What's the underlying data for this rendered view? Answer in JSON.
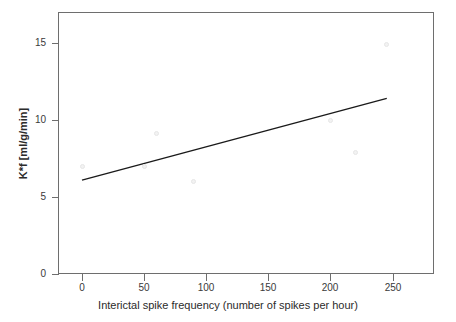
{
  "chart_data": {
    "type": "scatter",
    "title": "",
    "xlabel": "Interictal spike frequency (number of spikes per hour)",
    "ylabel": "K*f [ml/g/min]",
    "xlim": [
      -10,
      290
    ],
    "ylim": [
      0,
      16.6
    ],
    "xticks": [
      0,
      50,
      100,
      150,
      200,
      250
    ],
    "xtick_labels": [
      "0",
      "50",
      "100",
      "150",
      "200",
      "250"
    ],
    "yticks": [
      0,
      5,
      10,
      15
    ],
    "ytick_labels": [
      "0",
      "5",
      "10",
      "15"
    ],
    "grid": false,
    "legend": null,
    "series": [
      {
        "name": "Subjects",
        "type": "scatter",
        "marker": "open-circle",
        "color": "#e6e6e6",
        "points": [
          {
            "x": 0,
            "y": 7.0
          },
          {
            "x": 50,
            "y": 7.0
          },
          {
            "x": 60,
            "y": 9.1
          },
          {
            "x": 90,
            "y": 6.0
          },
          {
            "x": 200,
            "y": 10.0
          },
          {
            "x": 220,
            "y": 7.9
          },
          {
            "x": 245,
            "y": 14.9
          }
        ]
      },
      {
        "name": "Linear regression",
        "type": "line",
        "color": "#1a1a1a",
        "points": [
          {
            "x": 0,
            "y": 6.1
          },
          {
            "x": 245,
            "y": 11.4
          }
        ]
      }
    ]
  },
  "axes": {
    "x_title": "Interictal spike frequency (number of spikes per hour)",
    "y_title": "K*f [ml/g/min]",
    "x_tick_labels": [
      "0",
      "50",
      "100",
      "150",
      "200",
      "250"
    ],
    "y_tick_labels": [
      "0",
      "5",
      "10",
      "15"
    ]
  },
  "colors": {
    "frame": "#6e6e6e",
    "line": "#1a1a1a",
    "marker": "#e6e6e6",
    "text": "#2b2b2b",
    "background": "#ffffff"
  }
}
